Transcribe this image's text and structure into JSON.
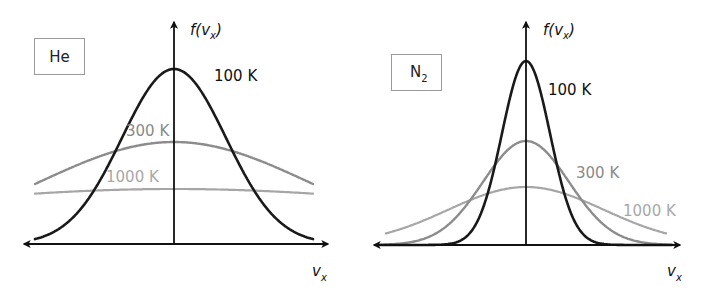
{
  "figure": {
    "panels": [
      {
        "id": "he",
        "gas_label": "He",
        "y_axis_label": {
          "prefix": "f(v",
          "sub": "x",
          "suffix": ")"
        },
        "x_axis_label": {
          "main": "v",
          "sub": "x"
        },
        "curves": [
          {
            "temperature": "100 K",
            "color": "#1a1a1a",
            "width": 2.6
          },
          {
            "temperature": "300 K",
            "color": "#8c8c8c",
            "width": 2.4
          },
          {
            "temperature": "1000 K",
            "color": "#a6a6a6",
            "width": 2.2
          }
        ]
      },
      {
        "id": "n2",
        "gas_label": {
          "main": "N",
          "sub": "2"
        },
        "y_axis_label": {
          "prefix": "f(v",
          "sub": "x",
          "suffix": ")"
        },
        "x_axis_label": {
          "main": "v",
          "sub": "x"
        },
        "curves": [
          {
            "temperature": "100 K",
            "color": "#1a1a1a",
            "width": 2.6
          },
          {
            "temperature": "300 K",
            "color": "#8c8c8c",
            "width": 2.4
          },
          {
            "temperature": "1000 K",
            "color": "#a6a6a6",
            "width": 2.2
          }
        ]
      }
    ],
    "colors": {
      "axis": "#111111",
      "box_border": "#9a9a9a",
      "label_100K": "#111111",
      "label_300K": "#8a8a8a",
      "label_1000K": "#a8a8a8"
    }
  }
}
